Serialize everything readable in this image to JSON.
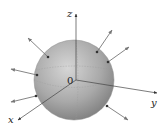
{
  "diagram": {
    "labels": {
      "z_axis": "z",
      "y_axis": "y",
      "x_axis": "x",
      "origin": "0"
    },
    "colors": {
      "sphere_light": "#c8c8c8",
      "sphere_dark": "#8a8a8a",
      "axis": "#444444",
      "arrow": "#777777",
      "dot": "#333333"
    },
    "sphere": {
      "cx": 74,
      "cy": 80,
      "r": 40
    },
    "axes": {
      "z": {
        "from": [
          76,
          80
        ],
        "to": [
          76,
          13
        ]
      },
      "y": {
        "from": [
          76,
          80
        ],
        "to": [
          157,
          93
        ]
      },
      "x": {
        "from": [
          76,
          80
        ],
        "to": [
          17,
          121
        ]
      }
    },
    "normals": [
      {
        "from": [
          48,
          57
        ],
        "to": [
          28,
          38
        ]
      },
      {
        "from": [
          97,
          52
        ],
        "to": [
          112,
          30
        ]
      },
      {
        "from": [
          108,
          62
        ],
        "to": [
          129,
          47
        ]
      },
      {
        "from": [
          37,
          75
        ],
        "to": [
          11,
          69
        ]
      },
      {
        "from": [
          36,
          96
        ],
        "to": [
          11,
          102
        ]
      },
      {
        "from": [
          107,
          106
        ],
        "to": [
          128,
          120
        ]
      }
    ]
  }
}
